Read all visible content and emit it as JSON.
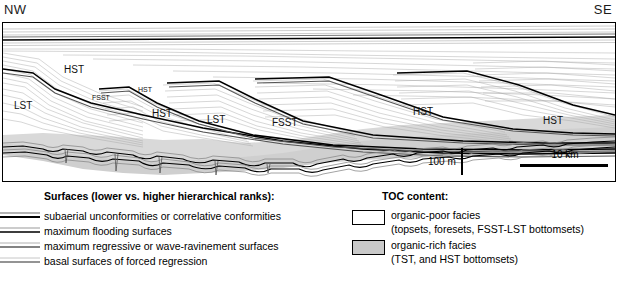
{
  "figure": {
    "orientation_left": "NW",
    "orientation_right": "SE",
    "systems_tract_labels": [
      {
        "text": "HST",
        "x": 62,
        "y": 45,
        "size": "normal"
      },
      {
        "text": "LST",
        "x": 14,
        "y": 83,
        "size": "normal"
      },
      {
        "text": "FSST",
        "x": 92,
        "y": 77,
        "size": "small"
      },
      {
        "text": "HST",
        "x": 137,
        "y": 68,
        "size": "small"
      },
      {
        "text": "HST",
        "x": 152,
        "y": 92,
        "size": "normal"
      },
      {
        "text": "LST",
        "x": 207,
        "y": 97,
        "size": "normal"
      },
      {
        "text": "FSST",
        "x": 272,
        "y": 100,
        "size": "normal"
      },
      {
        "text": "HST",
        "x": 413,
        "y": 89,
        "size": "normal"
      },
      {
        "text": "HST",
        "x": 543,
        "y": 98,
        "size": "normal"
      }
    ],
    "scale_vertical": "100 m",
    "scale_horizontal": "10 km",
    "colors": {
      "organic_poor": "#ffffff",
      "organic_rich": "#c9c9c9",
      "surface_high_rank": "#000000",
      "surface_low_rank": "#8a8a8a",
      "strata_line": "#9a9a9a"
    }
  },
  "legend": {
    "surfaces": {
      "title": "Surfaces (lower vs. higher hierarchical ranks):",
      "items": [
        {
          "label": "subaerial unconformities or correlative conformities"
        },
        {
          "label": "maximum flooding surfaces"
        },
        {
          "label": "maximum regressive or wave-ravinement surfaces"
        },
        {
          "label": "basal surfaces of forced regression"
        }
      ]
    },
    "toc": {
      "title": "TOC content:",
      "items": [
        {
          "swatch": "organic-poor-swatch",
          "label": "organic-poor facies",
          "sublabel": "(topsets, foresets, FSST-LST bottomsets)"
        },
        {
          "swatch": "organic-rich-swatch",
          "label": "organic-rich facies",
          "sublabel": "(TST, and HST bottomsets)"
        }
      ]
    }
  }
}
